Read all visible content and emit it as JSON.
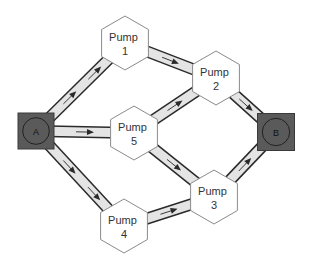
{
  "diagram": {
    "type": "flow-network",
    "colors": {
      "pipe_border": "#2a2a2a",
      "pipe_fill": "#e4e4e4",
      "hex_fill": "#ffffff",
      "hex_stroke": "#8a8a8a",
      "terminal_fill": "#5a5a5a",
      "text": "#333333"
    },
    "terminals": [
      {
        "id": "A",
        "label": "A",
        "x": 36,
        "y": 131,
        "size": 36
      },
      {
        "id": "B",
        "label": "B",
        "x": 276,
        "y": 132,
        "size": 37
      }
    ],
    "pumps": [
      {
        "id": "P1",
        "line1": "Pump",
        "line2": "1",
        "x": 125,
        "y": 43
      },
      {
        "id": "P2",
        "line1": "Pump",
        "line2": "2",
        "x": 216,
        "y": 78
      },
      {
        "id": "P5",
        "line1": "Pump",
        "line2": "5",
        "x": 134,
        "y": 133
      },
      {
        "id": "P3",
        "line1": "Pump",
        "line2": "3",
        "x": 214,
        "y": 197
      },
      {
        "id": "P4",
        "line1": "Pump",
        "line2": "4",
        "x": 124,
        "y": 226
      }
    ],
    "edges": [
      {
        "from": "A",
        "to": "P1",
        "arrows": 2
      },
      {
        "from": "A",
        "to": "P5",
        "arrows": 1
      },
      {
        "from": "A",
        "to": "P4",
        "arrows": 2
      },
      {
        "from": "P1",
        "to": "P2",
        "arrows": 1
      },
      {
        "from": "P5",
        "to": "P2",
        "arrows": 1
      },
      {
        "from": "P5",
        "to": "P3",
        "arrows": 1
      },
      {
        "from": "P4",
        "to": "P3",
        "arrows": 1
      },
      {
        "from": "P2",
        "to": "B",
        "arrows": 1
      },
      {
        "from": "P3",
        "to": "B",
        "arrows": 1
      }
    ]
  }
}
